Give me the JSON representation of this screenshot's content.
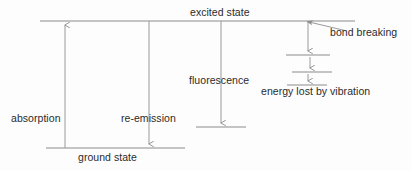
{
  "figure": {
    "type": "energy-level-diagram",
    "title_text": null,
    "background_color": "#fdfdfd",
    "line_color": "#8c8c8c",
    "text_color": "#2b2b2b"
  },
  "labels": {
    "excited_state": "excited state",
    "bond_breaking": "bond breaking",
    "fluorescence": "fluorescence",
    "energy_lost_by_vibration": "energy lost by vibration",
    "absorption": "absorption",
    "re_emission": "re-emission",
    "ground_state": "ground state"
  },
  "levels": [
    {
      "name": "excited-state-level",
      "x1": 40,
      "x2": 355,
      "y": 21
    },
    {
      "name": "vibrational-level-1",
      "x1": 286,
      "x2": 330,
      "y": 55
    },
    {
      "name": "vibrational-level-2",
      "x1": 292,
      "x2": 332,
      "y": 72
    },
    {
      "name": "vibrational-level-3",
      "x1": 287,
      "x2": 327,
      "y": 85
    },
    {
      "name": "fluorescence-final-level",
      "x1": 196,
      "x2": 246,
      "y": 127
    },
    {
      "name": "ground-state-level",
      "x1": 46,
      "x2": 185,
      "y": 148
    }
  ],
  "arrows": [
    {
      "name": "absorption-arrow",
      "x": 65,
      "y_from": 148,
      "y_to": 23,
      "direction": "up"
    },
    {
      "name": "re-emission-arrow",
      "x": 149,
      "y_from": 21,
      "y_to": 146,
      "direction": "down"
    },
    {
      "name": "fluorescence-arrow",
      "x": 221,
      "y_from": 21,
      "y_to": 125,
      "direction": "down"
    },
    {
      "name": "vibration-arrow-1",
      "x": 308,
      "y_from": 22,
      "y_to": 53,
      "direction": "down"
    },
    {
      "name": "vibration-arrow-2",
      "x": 310,
      "y_from": 57,
      "y_to": 70,
      "direction": "down"
    },
    {
      "name": "vibration-arrow-3",
      "x": 308,
      "y_from": 74,
      "y_to": 83,
      "direction": "down"
    }
  ],
  "leader_lines": [
    {
      "name": "bond-breaking-leader",
      "x_from": 345,
      "y_from": 30,
      "x_to": 305,
      "y_to": 21
    }
  ]
}
